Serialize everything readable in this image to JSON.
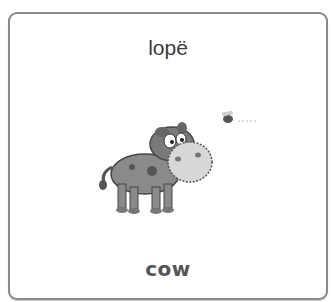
{
  "card": {
    "top_word": "lopë",
    "bottom_word": "cow",
    "illustration": "cartoon-cow-with-bee"
  }
}
